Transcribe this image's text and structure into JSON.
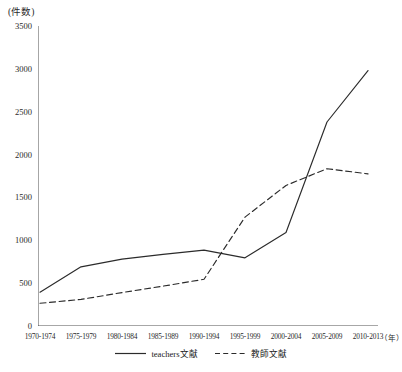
{
  "chart_data": {
    "type": "line",
    "title": "",
    "subtitle": "",
    "xlabel": "(年)",
    "ylabel": "(件数)",
    "ylim": [
      0,
      3500
    ],
    "y_ticks": [
      0,
      500,
      1000,
      1500,
      2000,
      2500,
      3000,
      3500
    ],
    "grid": false,
    "legend_position": "bottom-center",
    "categories": [
      "1970-1974",
      "1975-1979",
      "1980-1984",
      "1985-1989",
      "1990-1994",
      "1995-1999",
      "2000-2004",
      "2005-2009",
      "2010-2013"
    ],
    "series": [
      {
        "name": "teachers文献",
        "style": "solid",
        "color": "#2b2b2b",
        "values": [
          395,
          690,
          780,
          835,
          885,
          795,
          1090,
          2380,
          2980
        ]
      },
      {
        "name": "教師文献",
        "style": "dashed",
        "color": "#2b2b2b",
        "values": [
          265,
          310,
          390,
          465,
          545,
          1270,
          1640,
          1835,
          1775
        ]
      }
    ]
  },
  "axis": {
    "y_unit_label": "(件数)",
    "x_unit_label": "（年）"
  },
  "colors": {
    "background": "#ffffff",
    "axis": "#3a3a3a",
    "ink": "#2b2b2b"
  }
}
